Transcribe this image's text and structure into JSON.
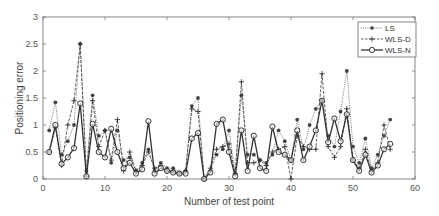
{
  "chart_data": {
    "type": "line",
    "title": "",
    "xlabel": "Number of test point",
    "ylabel": "Positioning error",
    "xlim": [
      0,
      60
    ],
    "ylim": [
      0,
      3
    ],
    "xticks": [
      0,
      10,
      20,
      30,
      40,
      50,
      60
    ],
    "yticks": [
      0,
      0.5,
      1,
      1.5,
      2,
      2.5,
      3
    ],
    "grid": false,
    "legend_position": "upper right",
    "x": [
      1,
      2,
      3,
      4,
      5,
      6,
      7,
      8,
      9,
      10,
      11,
      12,
      13,
      14,
      15,
      16,
      17,
      18,
      19,
      20,
      21,
      22,
      23,
      24,
      25,
      26,
      27,
      28,
      29,
      30,
      31,
      32,
      33,
      34,
      35,
      36,
      37,
      38,
      39,
      40,
      41,
      42,
      43,
      44,
      45,
      46,
      47,
      48,
      49,
      50,
      51,
      52,
      53,
      54,
      55,
      56
    ],
    "series": [
      {
        "name": "LS",
        "style": "dotted",
        "marker": "filled-dot",
        "values": [
          0.9,
          1.42,
          0.45,
          0.7,
          1.0,
          2.5,
          0.15,
          1.55,
          0.8,
          0.9,
          0.3,
          0.9,
          0.35,
          0.4,
          0.15,
          0.3,
          0.55,
          0.15,
          0.3,
          0.2,
          0.2,
          0.12,
          0.15,
          1.35,
          1.5,
          0.0,
          0.15,
          0.45,
          0.55,
          0.9,
          0.1,
          1.55,
          0.45,
          0.45,
          0.35,
          0.3,
          0.45,
          0.9,
          0.7,
          0.35,
          1.1,
          0.55,
          1.0,
          1.3,
          1.45,
          0.8,
          0.6,
          1.25,
          2.0,
          0.6,
          0.3,
          0.75,
          0.2,
          0.45,
          0.8,
          1.1
        ]
      },
      {
        "name": "WLS-D",
        "style": "dashed",
        "marker": "plus",
        "values": [
          0.5,
          0.95,
          0.25,
          1.0,
          1.45,
          2.5,
          0.05,
          1.45,
          0.6,
          0.9,
          0.35,
          1.1,
          0.15,
          0.5,
          0.15,
          0.25,
          0.5,
          0.2,
          0.25,
          0.15,
          0.15,
          0.1,
          0.15,
          1.3,
          1.25,
          0.0,
          0.2,
          0.55,
          0.6,
          0.65,
          0.1,
          1.8,
          0.3,
          0.3,
          0.35,
          0.25,
          0.5,
          0.55,
          0.6,
          0.0,
          0.8,
          0.6,
          0.55,
          0.55,
          1.95,
          0.6,
          0.4,
          0.6,
          1.3,
          0.35,
          0.2,
          0.55,
          0.15,
          0.3,
          1.0,
          0.55
        ]
      },
      {
        "name": "WLS-N",
        "style": "solid",
        "marker": "open-circle",
        "values": [
          0.5,
          1.0,
          0.28,
          0.4,
          0.57,
          1.4,
          0.05,
          1.02,
          0.5,
          0.4,
          0.93,
          0.5,
          0.2,
          0.3,
          0.1,
          0.18,
          1.07,
          0.1,
          0.2,
          0.15,
          0.12,
          0.1,
          0.1,
          0.75,
          0.85,
          0.0,
          0.12,
          1.02,
          1.1,
          0.5,
          0.05,
          0.9,
          0.15,
          0.8,
          0.2,
          0.15,
          0.97,
          0.5,
          0.45,
          0.35,
          0.9,
          0.35,
          0.6,
          0.9,
          1.45,
          0.68,
          1.12,
          0.7,
          1.2,
          0.35,
          0.15,
          0.45,
          0.12,
          0.25,
          0.55,
          0.65
        ]
      }
    ]
  },
  "legend": {
    "items": [
      {
        "label": "LS"
      },
      {
        "label": "WLS-D"
      },
      {
        "label": "WLS-N"
      }
    ]
  },
  "colors": {
    "axis": "#555555",
    "series_LS": "#555555",
    "series_WLSD": "#333333",
    "series_WLSN": "#444444"
  }
}
